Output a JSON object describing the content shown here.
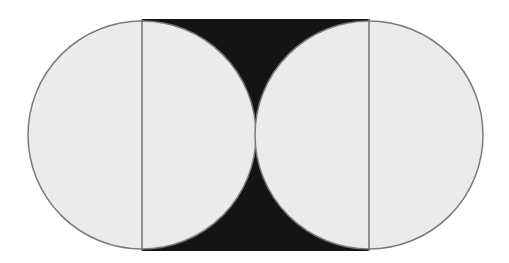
{
  "figure": {
    "colors": {
      "background": "#ffffff",
      "circle_fill": "#ebebeb",
      "circle_stroke": "#7a7a7a",
      "rectangle_fill": "#141414",
      "divider_line": "#6e6e6e"
    },
    "shapes": {
      "rectangle": {
        "x": 142,
        "y": 19,
        "width": 227,
        "height": 232
      },
      "left_circle": {
        "cx": 142,
        "cy": 135,
        "r": 114
      },
      "right_circle": {
        "cx": 369,
        "cy": 135,
        "r": 114
      },
      "left_divider": {
        "x": 142,
        "y1": 19,
        "y2": 251
      },
      "right_divider": {
        "x": 369,
        "y1": 19,
        "y2": 251
      }
    }
  }
}
